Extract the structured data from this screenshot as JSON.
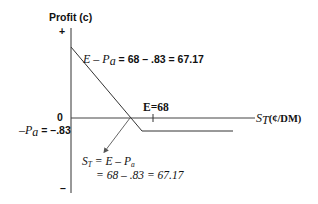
{
  "diagram": {
    "y_axis": {
      "label": "Profit (c)",
      "plus_marker": "+",
      "minus_marker": "–",
      "zero_label": "0",
      "premium_label_var": "–P",
      "premium_label_sub": "a",
      "premium_label_value": " = –.83"
    },
    "x_axis": {
      "label_var": "S",
      "label_sub": "T",
      "label_unit": "(¢/DM)",
      "strike_label": "E=68"
    },
    "max_profit_annotation": {
      "var_E": "E",
      "minus": " – ",
      "var_P": "P",
      "sub": "a",
      "value": " = 68 – .83 = 67.17"
    },
    "breakeven_annotation": {
      "line1_var_S": "S",
      "line1_sub_T": "T",
      "line1_eq": " = E – P",
      "line1_sub_a": "a",
      "line2": "= 68 – .83 = 67.17"
    },
    "values": {
      "strike_price": 68,
      "premium": 0.83,
      "max_profit": 67.17,
      "breakeven": 67.17
    },
    "colors": {
      "axis": "#333333",
      "payoff_line": "#333333",
      "arrow": "#555555",
      "text": "#111111"
    }
  }
}
